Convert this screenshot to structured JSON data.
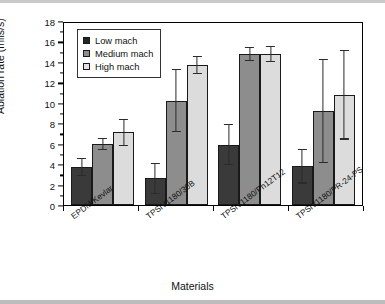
{
  "chart_data": {
    "type": "bar",
    "title": "",
    "xlabel": "Materials",
    "ylabel": "Ablation rate (mils/s)",
    "ylim": [
      0,
      18
    ],
    "ytick_step": 2,
    "ytick_labels": [
      "0",
      "2",
      "4",
      "6",
      "8",
      "10",
      "12",
      "14",
      "16",
      "18"
    ],
    "grid": false,
    "legend_position": "top-left",
    "categories": [
      "EPDM/Kevlar",
      "TPSiV1180/30B",
      "TPSiV1180/Ph12T12",
      "TPSiV1180/PR-24-PS"
    ],
    "series": [
      {
        "name": "Low mach",
        "color": "#3a3a3a",
        "values": [
          3.7,
          2.6,
          5.9,
          3.8
        ],
        "err_up": [
          0.9,
          1.5,
          2.0,
          1.7
        ],
        "err_down": [
          0.9,
          1.5,
          2.0,
          1.7
        ]
      },
      {
        "name": "Medium mach",
        "color": "#8d8d8d",
        "values": [
          6.0,
          10.2,
          14.8,
          9.2
        ],
        "err_up": [
          0.6,
          3.1,
          0.7,
          5.1
        ],
        "err_down": [
          0.6,
          3.1,
          0.7,
          5.1
        ]
      },
      {
        "name": "High mach",
        "color": "#dcdcdc",
        "values": [
          7.1,
          13.7,
          14.8,
          10.8
        ],
        "err_up": [
          1.3,
          0.9,
          0.8,
          4.4
        ],
        "err_down": [
          1.3,
          0.9,
          0.8,
          4.4
        ]
      }
    ]
  }
}
